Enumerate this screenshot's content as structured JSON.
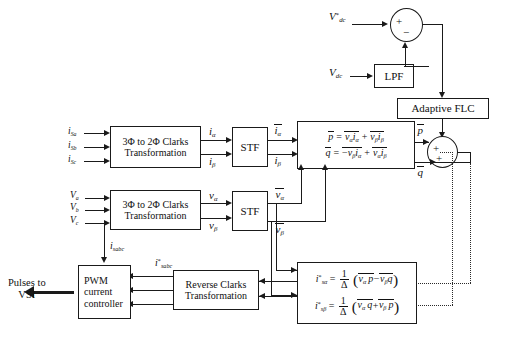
{
  "diagram": {
    "blocks": {
      "clarke_current": "3Φ to 2Φ Clarks Transformation",
      "clarke_current_line1": "3Φ to 2Φ Clarks",
      "clarke_current_line2": "Transformation",
      "stf_current": "STF",
      "clarke_voltage_line1": "3Φ to 2Φ Clarks",
      "clarke_voltage_line2": "Transformation",
      "stf_voltage": "STF",
      "lpf": "LPF",
      "adaptive_flc": "Adaptive FLC",
      "reverse_clarke_line1": "Reverse   Clarks",
      "reverse_clarke_line2": "Transformation",
      "pwm_line1": "PWM",
      "pwm_line2": "current",
      "pwm_line3": "controller"
    },
    "inputs": {
      "current_a": "i",
      "current_a_sub": "Sa",
      "current_b": "i",
      "current_b_sub": "Sb",
      "current_c": "i",
      "current_c_sub": "Sc",
      "voltage_a": "V",
      "voltage_a_sub": "a",
      "voltage_b": "V",
      "voltage_b_sub": "b",
      "voltage_c": "V",
      "voltage_c_sub": "c",
      "vdc_ref": "V",
      "vdc_ref_sub": "dc",
      "vdc_ref_sup": "*",
      "vdc": "V",
      "vdc_sub": "dc"
    },
    "signals": {
      "i_alpha": "i",
      "i_alpha_sub": "α",
      "i_beta": "i",
      "i_beta_sub": "β",
      "i_alpha_bar": "i",
      "i_alpha_bar_sub": "α",
      "i_beta_bar": "i",
      "i_beta_bar_sub": "β",
      "v_alpha": "v",
      "v_alpha_sub": "α",
      "v_beta": "v",
      "v_beta_sub": "β",
      "v_alpha_bar": "v",
      "v_alpha_bar_sub": "α",
      "v_beta_bar": "v",
      "v_beta_bar_sub": "β",
      "p_bar": "p",
      "q_bar": "q",
      "i_sabc": "i",
      "i_sabc_sub": "sabc",
      "i_sabc_ref": "i",
      "i_sabc_ref_sub": "sabc",
      "i_sabc_ref_sup": "*"
    },
    "equations": {
      "pq_p_lhs": "p",
      "pq_p_rhs": "= vα iα + vβ iβ",
      "pq_q_lhs": "q",
      "pq_q_rhs": "= −vβ iα + vα iβ",
      "iref_alpha_lhs": "i*sα",
      "iref_alpha_rhs": "= (1/Δ)( vα p − vβ q )",
      "iref_beta_lhs": "i*sβ",
      "iref_beta_rhs": "= (1/Δ)( vα q + vβ p )",
      "delta": "Δ",
      "one": "1",
      "plus": "+",
      "minus": "−"
    },
    "output": {
      "pulses_line1": "Pulses to",
      "pulses_line2": "VSI"
    },
    "summers": {
      "top_plus": "+",
      "top_minus": "−",
      "right_plus_1": "+",
      "right_plus_2": "+"
    },
    "colors": {
      "line": "#1a1a1a",
      "background": "#ffffff",
      "text": "#111111"
    }
  }
}
